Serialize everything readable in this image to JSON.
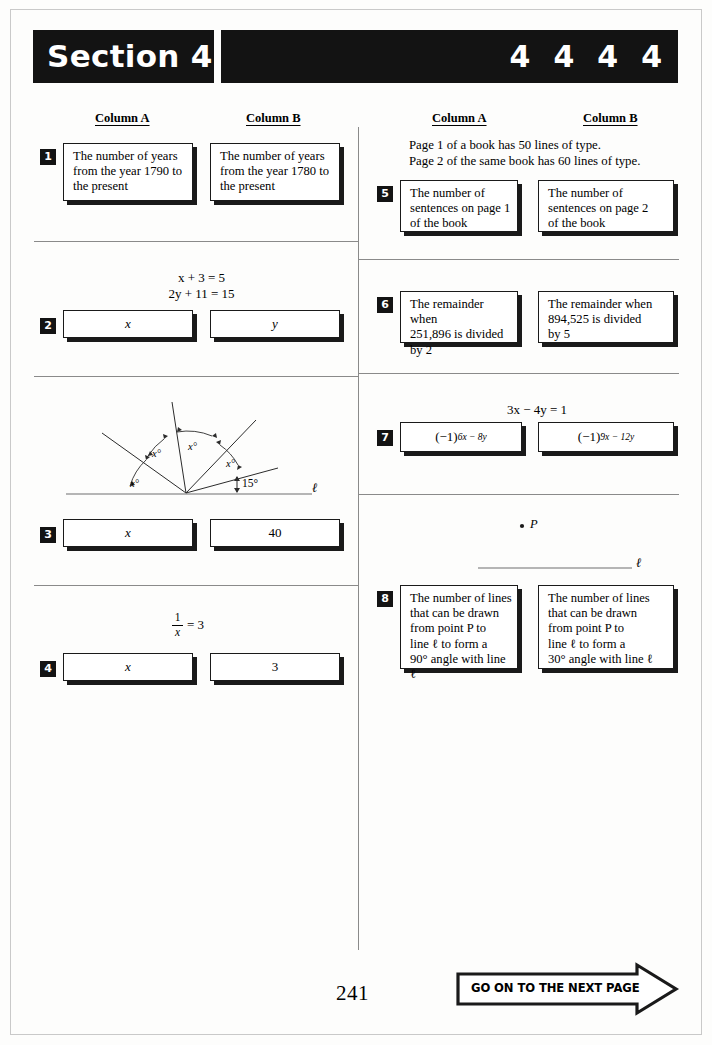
{
  "header": {
    "section_label": "Section 4",
    "section_numbers": [
      "4",
      "4",
      "4",
      "4"
    ]
  },
  "columns": {
    "left": {
      "column_a": "Column A",
      "column_b": "Column B"
    },
    "right": {
      "column_a": "Column A",
      "column_b": "Column B"
    }
  },
  "questions": [
    {
      "number": "1",
      "column_a": "The number of years\nfrom the year 1790 to\nthe present",
      "column_b": "The number of years\nfrom the year 1780 to\nthe present"
    },
    {
      "number": "2",
      "stem": "x + 3 = 5\n2y + 11 = 15",
      "column_a": "x",
      "column_b": "y"
    },
    {
      "number": "3",
      "figure": {
        "angle_labels": [
          "x°",
          "x°",
          "x°",
          "x°"
        ],
        "known_angle": "15°",
        "line_label": "ℓ"
      },
      "column_a": "x",
      "column_b": "40"
    },
    {
      "number": "4",
      "stem_fraction": {
        "numerator": "1",
        "denominator": "x",
        "rest": "= 3"
      },
      "column_a": "x",
      "column_b": "3"
    },
    {
      "number": "5",
      "stem": "Page 1 of a book has 50 lines of type.\nPage 2 of the same book has 60 lines of type.",
      "column_a": "The number of\nsentences on page 1\nof the book",
      "column_b": "The number of\nsentences on page 2\nof the book"
    },
    {
      "number": "6",
      "column_a": "The remainder when\n251,896 is divided\nby 2",
      "column_b": "The remainder when\n894,525 is divided\nby 5"
    },
    {
      "number": "7",
      "stem": "3x − 4y = 1",
      "column_a_base": "(−1)",
      "column_a_exponent": "6x − 8y",
      "column_b_base": "(−1)",
      "column_b_exponent": "9x − 12y"
    },
    {
      "number": "8",
      "figure": {
        "point_label": "P",
        "line_label": "ℓ"
      },
      "column_a": "The number of lines\nthat can be drawn\nfrom point P to\nline ℓ to form a\n90° angle with line ℓ",
      "column_b": "The number of lines\nthat can be drawn\nfrom point P to\nline ℓ to form a\n30° angle with line ℓ"
    }
  ],
  "footer": {
    "page_number": "241",
    "next_page_label": "GO ON TO THE NEXT PAGE"
  },
  "colors": {
    "ink": "#131313",
    "rule": "#8a8a8a",
    "paper": "#fdfdfc"
  }
}
